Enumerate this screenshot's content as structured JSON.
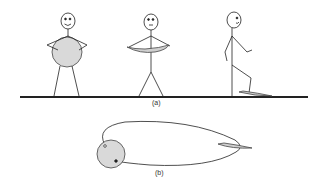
{
  "figure": {
    "panel_a": {
      "label": "(a)",
      "figures": [
        {
          "name": "figure-holding-sphere",
          "expression": "smile",
          "holding": "sphere"
        },
        {
          "name": "figure-holding-flattened-shape",
          "expression": "neutral",
          "holding": "flattened-disk"
        },
        {
          "name": "figure-walking-on-sheet",
          "expression": "smile",
          "holding": "none",
          "under_foot": "flat-sheet"
        }
      ]
    },
    "panel_b": {
      "label": "(b)",
      "elements": [
        "sphere",
        "connecting-loop",
        "flat-sheet"
      ]
    },
    "colors": {
      "line": "#222222",
      "fill_gray": "#d9d9d9",
      "background": "#ffffff"
    }
  }
}
